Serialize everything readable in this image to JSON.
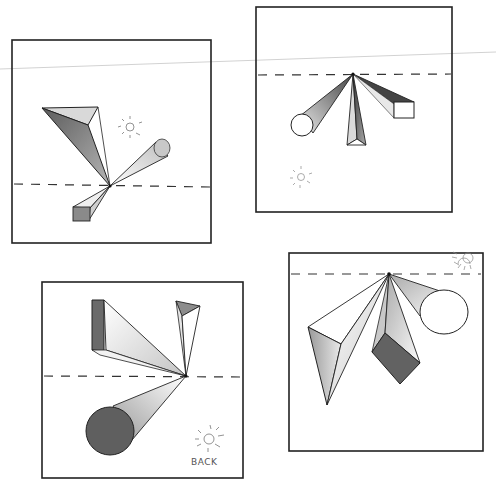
{
  "colors": {
    "paper": "#ffffff",
    "ink": "#222222",
    "shade_dark": "#6e6e6e",
    "shade_mid": "#a8a8a8",
    "shade_light": "#d6d6d6",
    "scan_line": "#cfcfcf"
  },
  "panels": [
    {
      "id": "top-left",
      "horizon": "below-center",
      "vanishing_point": "center",
      "objects": [
        "triangular-prism",
        "cylinder",
        "rectangular-prism"
      ],
      "light_source": "sun-icon upper-right"
    },
    {
      "id": "top-right",
      "horizon": "top",
      "vanishing_point": "center-top",
      "objects": [
        "cylinder",
        "triangular-prism",
        "rectangular-prism"
      ],
      "light_source": "sun-icon lower-left"
    },
    {
      "id": "bottom-left",
      "horizon": "center",
      "vanishing_point": "right-center",
      "objects": [
        "rectangular-prism",
        "triangular-prism",
        "cylinder"
      ],
      "light_source": "sun-icon lower-right",
      "label": "BACK"
    },
    {
      "id": "bottom-right",
      "horizon": "top",
      "vanishing_point": "center-top",
      "objects": [
        "triangular-prism",
        "rectangular-prism",
        "cylinder"
      ],
      "light_source": "sun-icon upper-right"
    }
  ]
}
